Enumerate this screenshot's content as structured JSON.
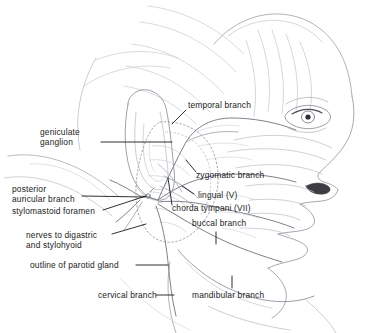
{
  "figure": {
    "type": "anatomical-line-drawing",
    "background_color": "#ffffff",
    "line_color": "#8c8c96",
    "leader_color": "#1a1a1a",
    "text_color": "#1a1a1a",
    "dotted_outline_color": "#9a9aa4"
  },
  "labels": [
    {
      "id": "temporal-branch",
      "text": "temporal branch",
      "align": "left",
      "x": 188,
      "y": 105
    },
    {
      "id": "geniculate-ganglion",
      "text": "geniculate\nganglion",
      "align": "left",
      "x": 40,
      "y": 127
    },
    {
      "id": "zygomatic-branch",
      "text": "zygomatic branch",
      "align": "left",
      "x": 196,
      "y": 174
    },
    {
      "id": "posterior-auricular",
      "text": "posterior\nauricular branch",
      "align": "left",
      "x": 12,
      "y": 184
    },
    {
      "id": "lingual-v",
      "text": "lingual (V)",
      "align": "left",
      "x": 196,
      "y": 192
    },
    {
      "id": "stylomastoid-foramen",
      "text": "stylomastoid foramen",
      "align": "left",
      "x": 12,
      "y": 212
    },
    {
      "id": "chorda-tympani-vii",
      "text": "chorda tympani (VII)",
      "align": "left",
      "x": 170,
      "y": 208
    },
    {
      "id": "buccal-branch",
      "text": "buccal branch",
      "align": "left",
      "x": 192,
      "y": 222
    },
    {
      "id": "nerves-digastric",
      "text": "nerves to digastric\nand stylohyoid",
      "align": "left",
      "x": 26,
      "y": 232
    },
    {
      "id": "outline-parotid-gland",
      "text": "outline of parotid gland",
      "align": "left",
      "x": 30,
      "y": 261
    },
    {
      "id": "cervical-branch",
      "text": "cervical branch",
      "align": "left",
      "x": 98,
      "y": 291
    },
    {
      "id": "mandibular-branch",
      "text": "mandibular branch",
      "align": "left",
      "x": 192,
      "y": 291
    }
  ],
  "structures": [
    "forehead",
    "eye",
    "eyebrow",
    "nose",
    "nostril",
    "upper lip",
    "lower lip",
    "chin",
    "jawline",
    "ear (auricle)",
    "parotid gland outline",
    "facial nerve trunk",
    "temporal branch",
    "zygomatic branch",
    "buccal branch",
    "mandibular branch",
    "cervical branch",
    "posterior auricular branch",
    "chorda tympani",
    "lingual nerve",
    "geniculate ganglion",
    "stylomastoid foramen",
    "neck"
  ]
}
